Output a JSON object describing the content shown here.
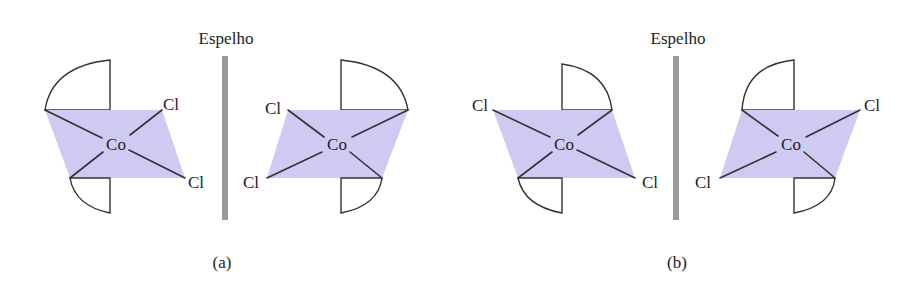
{
  "colors": {
    "plane_fill": "#cfcaf2",
    "bond": "#333333",
    "mirror": "#9a9a9a",
    "text": "#222222"
  },
  "panels": [
    {
      "caption": "(a)",
      "mirror_label": "Espelho",
      "molecules": [
        {
          "center": "Co",
          "ligands": [
            "Cl",
            "Cl"
          ],
          "ligand_positions": [
            "upper-right",
            "lower-right"
          ]
        },
        {
          "center": "Co",
          "ligands": [
            "Cl",
            "Cl"
          ],
          "ligand_positions": [
            "upper-left",
            "lower-left"
          ]
        }
      ]
    },
    {
      "caption": "(b)",
      "mirror_label": "Espelho",
      "molecules": [
        {
          "center": "Co",
          "ligands": [
            "Cl",
            "Cl"
          ],
          "ligand_positions": [
            "upper-left",
            "lower-right"
          ]
        },
        {
          "center": "Co",
          "ligands": [
            "Cl",
            "Cl"
          ],
          "ligand_positions": [
            "upper-right",
            "lower-left"
          ]
        }
      ]
    }
  ]
}
